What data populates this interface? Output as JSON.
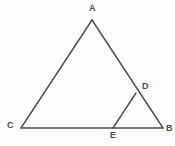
{
  "figure": {
    "kind": "geometry-diagram",
    "background_color": "#fdfdfd",
    "stroke_color": "#4b4b4b",
    "label_color": "#4b4b4b",
    "stroke_width": 1.4,
    "width": 175,
    "height": 146
  },
  "points": {
    "A": {
      "label": "A",
      "x": 92,
      "y": 20
    },
    "B": {
      "label": "B",
      "x": 163,
      "y": 128
    },
    "C": {
      "label": "C",
      "x": 21,
      "y": 128
    },
    "D": {
      "label": "D",
      "x": 136,
      "y": 93
    },
    "E": {
      "label": "E",
      "x": 113,
      "y": 128
    }
  },
  "segments": [
    {
      "name": "AC",
      "from": "A",
      "to": "C"
    },
    {
      "name": "AB",
      "from": "A",
      "to": "B"
    },
    {
      "name": "CB",
      "from": "C",
      "to": "B"
    },
    {
      "name": "ED",
      "from": "E",
      "to": "D"
    }
  ]
}
